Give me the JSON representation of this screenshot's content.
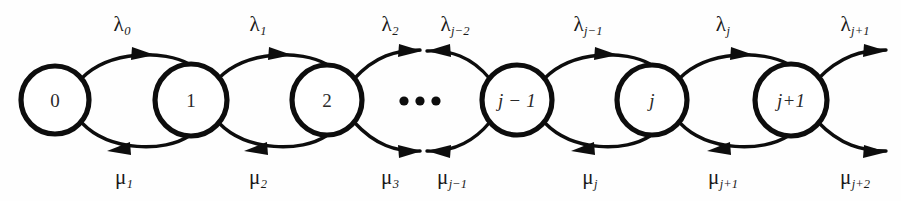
{
  "diagram": {
    "type": "birth-death-markov-chain-state-transition-diagram",
    "ellipsis": "•••",
    "states": [
      {
        "id": "s0",
        "label": "0",
        "cx": 55,
        "cy": 100,
        "r": 34
      },
      {
        "id": "s1",
        "label": "1",
        "cx": 191,
        "cy": 100,
        "r": 36
      },
      {
        "id": "s2",
        "label": "2",
        "cx": 327,
        "cy": 100,
        "r": 35
      },
      {
        "id": "sjm1",
        "label": "j − 1",
        "cx": 517,
        "cy": 100,
        "r": 35
      },
      {
        "id": "sj",
        "label": "j",
        "cx": 652,
        "cy": 100,
        "r": 35
      },
      {
        "id": "sjp1",
        "label": "j+1",
        "cx": 791,
        "cy": 100,
        "r": 36
      }
    ],
    "birth_rates": [
      {
        "id": "lambda-0",
        "greek": "λ",
        "sub": "0",
        "x": 122,
        "y": 25
      },
      {
        "id": "lambda-1",
        "greek": "λ",
        "sub": "1",
        "x": 258,
        "y": 25
      },
      {
        "id": "lambda-2",
        "greek": "λ",
        "sub": "2",
        "x": 390,
        "y": 25
      },
      {
        "id": "lambda-jm2",
        "greek": "λ",
        "sub": "j−2",
        "x": 455,
        "y": 25
      },
      {
        "id": "lambda-jm1",
        "greek": "λ",
        "sub": "j−1",
        "x": 588,
        "y": 25
      },
      {
        "id": "lambda-j",
        "greek": "λ",
        "sub": "j",
        "x": 723,
        "y": 25
      },
      {
        "id": "lambda-jp1",
        "greek": "λ",
        "sub": "j+1",
        "x": 855,
        "y": 25
      }
    ],
    "death_rates": [
      {
        "id": "mu-1",
        "greek": "μ",
        "sub": "1",
        "x": 124,
        "y": 178
      },
      {
        "id": "mu-2",
        "greek": "μ",
        "sub": "2",
        "x": 258,
        "y": 178
      },
      {
        "id": "mu-3",
        "greek": "μ",
        "sub": "3",
        "x": 390,
        "y": 178
      },
      {
        "id": "mu-jm1",
        "greek": "μ",
        "sub": "j−1",
        "x": 452,
        "y": 178
      },
      {
        "id": "mu-j",
        "greek": "μ",
        "sub": "j",
        "x": 590,
        "y": 178
      },
      {
        "id": "mu-jp1",
        "greek": "μ",
        "sub": "j+1",
        "x": 723,
        "y": 178
      },
      {
        "id": "mu-jp2",
        "greek": "μ",
        "sub": "j+2",
        "x": 855,
        "y": 178
      }
    ],
    "colors": {
      "stroke": "#0d0d0d",
      "background": "#ffffff",
      "text": "#1a1a1a"
    }
  }
}
